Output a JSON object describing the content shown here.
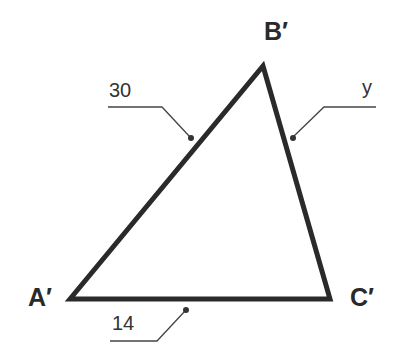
{
  "figure": {
    "type": "triangle",
    "vertices": [
      {
        "name": "A'",
        "x": 70,
        "y": 299
      },
      {
        "name": "B'",
        "x": 263,
        "y": 66
      },
      {
        "name": "C'",
        "x": 330,
        "y": 299
      }
    ],
    "vertex_labels": {
      "A": "A′",
      "B": "B′",
      "C": "C′"
    },
    "side_labels": {
      "A_B": "30",
      "B_C": "y",
      "A_C": "14"
    },
    "colors": {
      "stroke": "#2a2a2a",
      "background": "#ffffff"
    }
  }
}
